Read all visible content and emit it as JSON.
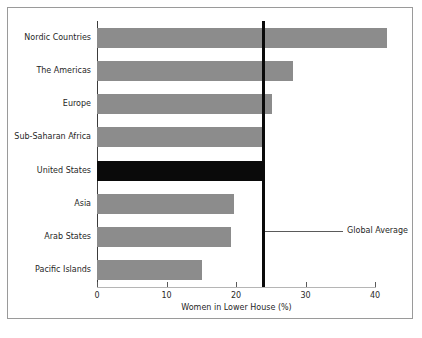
{
  "chart_data": {
    "type": "bar",
    "orientation": "horizontal",
    "title": "",
    "xlabel": "Women in Lower House (%)",
    "ylabel": "",
    "categories": [
      "Nordic Countries",
      "The Americas",
      "Europe",
      "Sub-Saharan Africa",
      "United States",
      "Asia",
      "Arab States",
      "Pacific Islands"
    ],
    "values": [
      41.7,
      28.2,
      25.2,
      23.8,
      24.1,
      19.7,
      19.3,
      15.1
    ],
    "xlim": [
      0,
      42.5
    ],
    "xticks": [
      0,
      10,
      20,
      30,
      40
    ],
    "xtick_labels": [
      "0",
      "10",
      "20",
      "30",
      "40"
    ],
    "grid": false,
    "legend": "none",
    "highlight_category": "United States",
    "bar_color": "#8c8c8c",
    "highlight_color": "#0a0a0a",
    "reference_line": {
      "label": "Global Average",
      "value": 23.9,
      "color": "#0a0a0a"
    },
    "annotations": [
      {
        "text": "Global Average",
        "value": 23.9
      }
    ]
  },
  "figure": {
    "background": "#ffffff",
    "frame_color": "#9a9a9a"
  }
}
